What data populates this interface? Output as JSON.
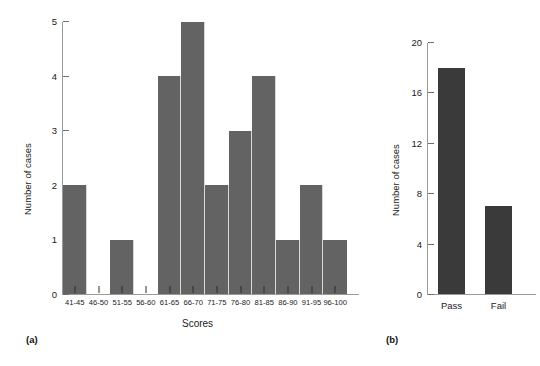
{
  "figure": {
    "background": "#ffffff",
    "panels": [
      {
        "caption": "(a)",
        "bar_color": "#636363",
        "axis_color": "#9a9a9a"
      },
      {
        "caption": "(b)",
        "bar_color": "#3a3a3a",
        "axis_color": "#9a9a9a"
      }
    ]
  },
  "panel_a": {
    "caption": "(a)",
    "ylabel": "Number of cases",
    "xlabel": "Scores",
    "yticks": [
      "0",
      "1",
      "2",
      "3",
      "4",
      "5"
    ],
    "xticks": [
      "41-45",
      "46-50",
      "51-55",
      "56-60",
      "61-65",
      "66-70",
      "71-75",
      "76-80",
      "81-85",
      "86-90",
      "91-95",
      "96-100"
    ]
  },
  "panel_b": {
    "caption": "(b)",
    "ylabel": "Number of cases",
    "xlabel": "",
    "yticks": [
      "0",
      "4",
      "8",
      "12",
      "16",
      "20"
    ],
    "xticks": [
      "Pass",
      "Fail"
    ]
  },
  "chart_data": [
    {
      "type": "bar",
      "panel": "(a)",
      "title": "",
      "xlabel": "Scores",
      "ylabel": "Number of cases",
      "categories": [
        "41-45",
        "46-50",
        "51-55",
        "56-60",
        "61-65",
        "66-70",
        "71-75",
        "76-80",
        "81-85",
        "86-90",
        "91-95",
        "96-100"
      ],
      "values": [
        2,
        0,
        1,
        0,
        4,
        5,
        2,
        3,
        4,
        1,
        2,
        1
      ],
      "ylim": [
        0,
        5
      ],
      "yticks": [
        0,
        1,
        2,
        3,
        4,
        5
      ],
      "grid": false,
      "legend": false,
      "bar_color": "#636363",
      "bar_gap": 0
    },
    {
      "type": "bar",
      "panel": "(b)",
      "title": "",
      "xlabel": "",
      "ylabel": "Number of cases",
      "categories": [
        "Pass",
        "Fail"
      ],
      "values": [
        18,
        7
      ],
      "ylim": [
        0,
        20
      ],
      "yticks": [
        0,
        4,
        8,
        12,
        16,
        20
      ],
      "grid": false,
      "legend": false,
      "bar_color": "#3a3a3a"
    }
  ]
}
